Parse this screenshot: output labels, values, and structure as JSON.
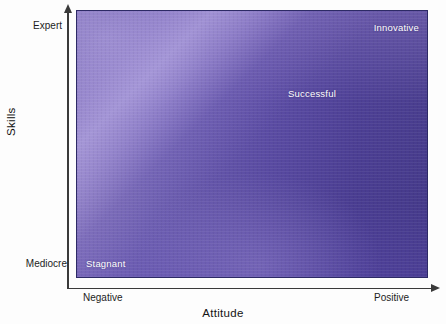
{
  "chart_data": {
    "type": "heatmap",
    "title": "",
    "xlabel": "Attitude",
    "ylabel": "Skills",
    "x_tick_labels": [
      "Negative",
      "Positive"
    ],
    "y_tick_labels": [
      "Mediocre",
      "Expert"
    ],
    "xlim": [
      "Negative",
      "Positive"
    ],
    "ylim": [
      "Mediocre",
      "Expert"
    ],
    "grid": false,
    "legend": "none",
    "annotations": [
      {
        "text": "Innovative",
        "x": "Positive",
        "y": "Expert",
        "quadrant": "top-right"
      },
      {
        "text": "Successful",
        "x": "Mid-Positive",
        "y": "Upper-Mid",
        "quadrant": "upper-middle"
      },
      {
        "text": "Stagnant",
        "x": "Negative",
        "y": "Mediocre",
        "quadrant": "bottom-left"
      }
    ],
    "colors": {
      "top_left": "#8c7cc4",
      "top_right": "#483c8c",
      "bottom_left": "#4a3f8a",
      "bottom_right": "#5040a0",
      "diagonal_highlight": "#a596d8",
      "border": "#2d2a66",
      "label_text": "#ffffff",
      "axis": "#3a3a3a",
      "axis_text": "#141414"
    }
  },
  "axes": {
    "x": {
      "title": "Attitude",
      "low_label": "Negative",
      "high_label": "Positive"
    },
    "y": {
      "title": "Skills",
      "low_label": "Mediocre",
      "high_label": "Expert"
    }
  },
  "quadrant_labels": {
    "innovative": "Innovative",
    "successful": "Successful",
    "stagnant": "Stagnant"
  }
}
